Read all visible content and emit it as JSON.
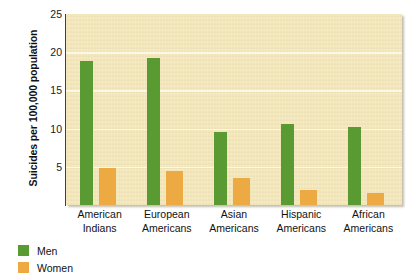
{
  "chart_data": {
    "type": "bar",
    "title": "",
    "subtitle": "",
    "xlabel": "",
    "ylabel": "Suicides per 100,000 population",
    "categories": [
      "American Indians",
      "European Americans",
      "Asian Americans",
      "Hispanic Americans",
      "African Americans"
    ],
    "category_lines": [
      [
        "American",
        "Indians"
      ],
      [
        "European",
        "Americans"
      ],
      [
        "Asian",
        "Americans"
      ],
      [
        "Hispanic",
        "Americans"
      ],
      [
        "African",
        "Americans"
      ]
    ],
    "series": [
      {
        "name": "Men",
        "color": "#5a9a33",
        "values": [
          18.8,
          19.2,
          9.5,
          10.6,
          10.2
        ]
      },
      {
        "name": "Women",
        "color": "#edaa42",
        "values": [
          4.8,
          4.4,
          3.5,
          2.0,
          1.6
        ]
      }
    ],
    "ylim": [
      0,
      25
    ],
    "yticks": [
      0,
      5,
      10,
      15,
      20,
      25
    ],
    "ytick_labels": [
      "",
      "5",
      "10",
      "15",
      "20",
      "25"
    ],
    "grid": true,
    "grid_axis": "y",
    "legend_position": "bottom-left",
    "plot_background": "#f3e7bb"
  },
  "legend": {
    "items": [
      {
        "label": "Men",
        "color": "#5a9a33"
      },
      {
        "label": "Women",
        "color": "#edaa42"
      }
    ]
  }
}
